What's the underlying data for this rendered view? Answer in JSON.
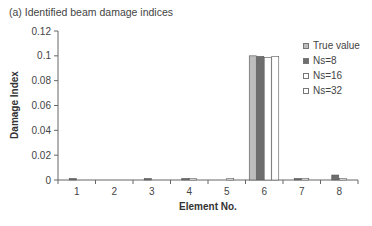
{
  "chart_data": {
    "type": "bar",
    "title": "(a) Identified beam damage indices",
    "xlabel": "Element No.",
    "ylabel": "Damage Index",
    "ylim": [
      0,
      0.12
    ],
    "yticks": [
      "0",
      "0.02",
      "0.04",
      "0.06",
      "0.08",
      "0.1",
      "0.12"
    ],
    "categories": [
      "1",
      "2",
      "3",
      "4",
      "5",
      "6",
      "7",
      "8"
    ],
    "grid": false,
    "legend_position": "right",
    "series": [
      {
        "name": "True value",
        "color": "#bdbdbd",
        "values": [
          0,
          0,
          0,
          0,
          0,
          0.1,
          0,
          0
        ]
      },
      {
        "name": "Ns=8",
        "color": "#6e6e6e",
        "values": [
          0.0008,
          0,
          0.0008,
          0.0012,
          0,
          0.0995,
          0.0008,
          0.004
        ]
      },
      {
        "name": "Ns=16",
        "color": "#ffffff",
        "values": [
          0,
          0,
          0,
          0.0008,
          0.0006,
          0.0985,
          0.0008,
          0.0005
        ]
      },
      {
        "name": "Ns=32",
        "color": "#ffffff",
        "values": [
          0,
          0,
          0,
          0,
          0,
          0.0995,
          0,
          0
        ]
      }
    ]
  },
  "legend": {
    "items": [
      {
        "label": "True value"
      },
      {
        "label": "Ns=8"
      },
      {
        "label": "Ns=16"
      },
      {
        "label": "Ns=32"
      }
    ]
  }
}
